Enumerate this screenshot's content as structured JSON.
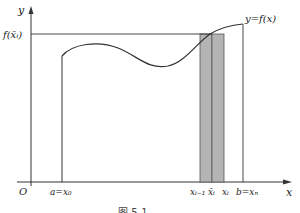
{
  "diagram": {
    "axes": {
      "y_label": "y",
      "x_label": "x",
      "origin_label": "O"
    },
    "curve_label": "y=f(x)",
    "value_label": "f(x̄ᵢ)",
    "x_tick_labels": {
      "a": "a=x₀",
      "x_im1": "xᵢ₋₁",
      "xbar_i": "x̄ᵢ",
      "x_i": "xᵢ",
      "b": "b=xₙ"
    },
    "caption": "图 5-1",
    "colors": {
      "line": "#333333",
      "shade": "#b4b4b4",
      "background": "#ffffff"
    }
  }
}
